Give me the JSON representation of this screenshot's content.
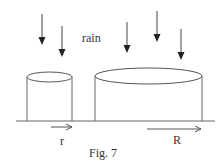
{
  "figure": {
    "caption": "Fig. 7",
    "rain_label": "rain",
    "small_radius_label": "r",
    "large_radius_label": "R"
  },
  "colors": {
    "line": "#555555",
    "arrow": "#333333",
    "background": "#ffffff"
  },
  "diagram": {
    "rain_arrows": [
      {
        "x": 42,
        "y1": 14,
        "y2": 45
      },
      {
        "x": 62,
        "y1": 26,
        "y2": 57
      },
      {
        "x": 127,
        "y1": 22,
        "y2": 53
      },
      {
        "x": 157,
        "y1": 11,
        "y2": 42
      },
      {
        "x": 181,
        "y1": 29,
        "y2": 60
      }
    ],
    "cylinders": [
      {
        "name": "small",
        "left": 26,
        "right": 73,
        "top_y": 77,
        "ry": 5,
        "ground_y": 121
      },
      {
        "name": "large",
        "left": 94,
        "right": 203,
        "top_y": 76,
        "ry": 8,
        "ground_y": 121
      }
    ]
  }
}
